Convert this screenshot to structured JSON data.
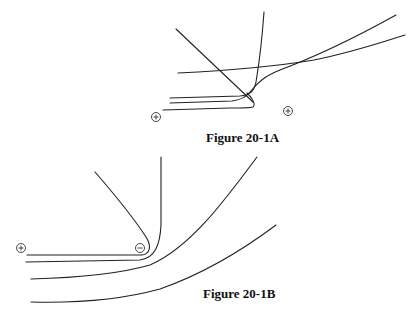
{
  "figures": [
    {
      "id": "20-1A",
      "caption": "Figure 20-1A",
      "charges": [
        {
          "symbol": "+",
          "x": 156,
          "y": 117
        },
        {
          "symbol": "+",
          "x": 288,
          "y": 111
        }
      ]
    },
    {
      "id": "20-1B",
      "caption": "Figure 20-1B",
      "charges": [
        {
          "symbol": "+",
          "x": 21,
          "y": 248
        },
        {
          "symbol": "-",
          "x": 140,
          "y": 248
        }
      ]
    }
  ]
}
